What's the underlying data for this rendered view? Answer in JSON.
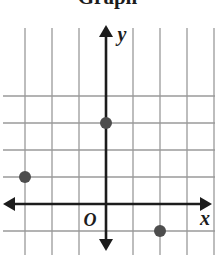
{
  "title": "Graph",
  "chart_data": {
    "type": "scatter",
    "title": "Graph",
    "xlabel": "x",
    "ylabel": "y",
    "origin_label": "O",
    "grid": true,
    "legend": "none",
    "xlim": [
      -4,
      4
    ],
    "ylim": [
      -2,
      4
    ],
    "xticks": [
      -4,
      -3,
      -2,
      -1,
      0,
      1,
      2,
      3,
      4
    ],
    "yticks": [
      -2,
      -1,
      0,
      1,
      2,
      3,
      4
    ],
    "tick_labels_shown": false,
    "points": [
      {
        "x": 0,
        "y": 3
      },
      {
        "x": -3,
        "y": 1
      },
      {
        "x": 2,
        "y": -1
      }
    ],
    "axis_arrows": [
      "up",
      "down",
      "left",
      "right"
    ],
    "colors": {
      "grid": "#9a9a9a",
      "axis": "#1c1c1c",
      "point": "#4d4d4d",
      "text": "#1c1c1c",
      "background": "#ffffff"
    }
  },
  "geometry": {
    "origin_px": {
      "x": 106,
      "y": 204
    },
    "cell_px": 27,
    "point_radius_px": 6
  }
}
